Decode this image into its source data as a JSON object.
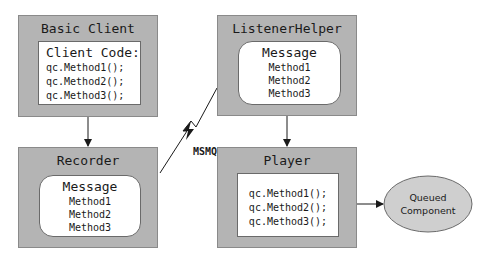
{
  "diagram": {
    "basic_client": {
      "title": "Basic Client",
      "inner_heading": "Client Code:",
      "lines": [
        "qc.Method1();",
        "qc.Method2();",
        "qc.Method3();"
      ]
    },
    "recorder": {
      "title": "Recorder",
      "inner_heading": "Message",
      "lines": [
        "Method1",
        "Method2",
        "Method3"
      ]
    },
    "listener_helper": {
      "title": "ListenerHelper",
      "inner_heading": "Message",
      "lines": [
        "Method1",
        "Method2",
        "Method3"
      ]
    },
    "player": {
      "title": "Player",
      "lines": [
        "qc.Method1();",
        "qc.Method2();",
        "qc.Method3();"
      ]
    },
    "queued_component": {
      "line1": "Queued",
      "line2": "Component"
    },
    "transport_label": "MSMQ",
    "colors": {
      "box_fill": "#b4b4b4",
      "inner_fill": "#ffffff",
      "ellipse_fill": "#cfcfcf",
      "line": "#1a1a1a"
    },
    "connections": [
      {
        "from": "Basic Client",
        "to": "Recorder",
        "type": "arrow"
      },
      {
        "from": "Recorder",
        "to": "ListenerHelper",
        "type": "lightning",
        "label": "MSMQ"
      },
      {
        "from": "ListenerHelper",
        "to": "Player",
        "type": "arrow"
      },
      {
        "from": "Player",
        "to": "Queued Component",
        "type": "arrow"
      }
    ]
  }
}
